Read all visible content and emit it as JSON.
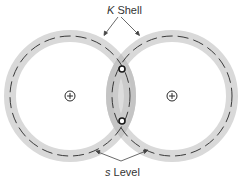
{
  "diagram": {
    "type": "H2 molecule electron orbitals",
    "labels": {
      "k_shell_symbol": "K",
      "k_shell_word": " Shell",
      "s_level_symbol": "s",
      "s_level_word": " Level"
    },
    "atoms": [
      {
        "id": "left",
        "nucleus_symbol": "+",
        "cx": 70,
        "cy": 96
      },
      {
        "id": "right",
        "nucleus_symbol": "+",
        "cx": 172,
        "cy": 96
      }
    ],
    "electrons": [
      {
        "id": "upper",
        "cx": 122,
        "cy": 69
      },
      {
        "id": "lower",
        "cx": 122,
        "cy": 121
      }
    ],
    "orbit_radius": 60,
    "band_width": 12,
    "colors": {
      "band": "#d9d9d9",
      "overlap": "#c4c4c4",
      "dash": "#3a3a3a",
      "text": "#333333",
      "arrow": "#444444"
    }
  }
}
